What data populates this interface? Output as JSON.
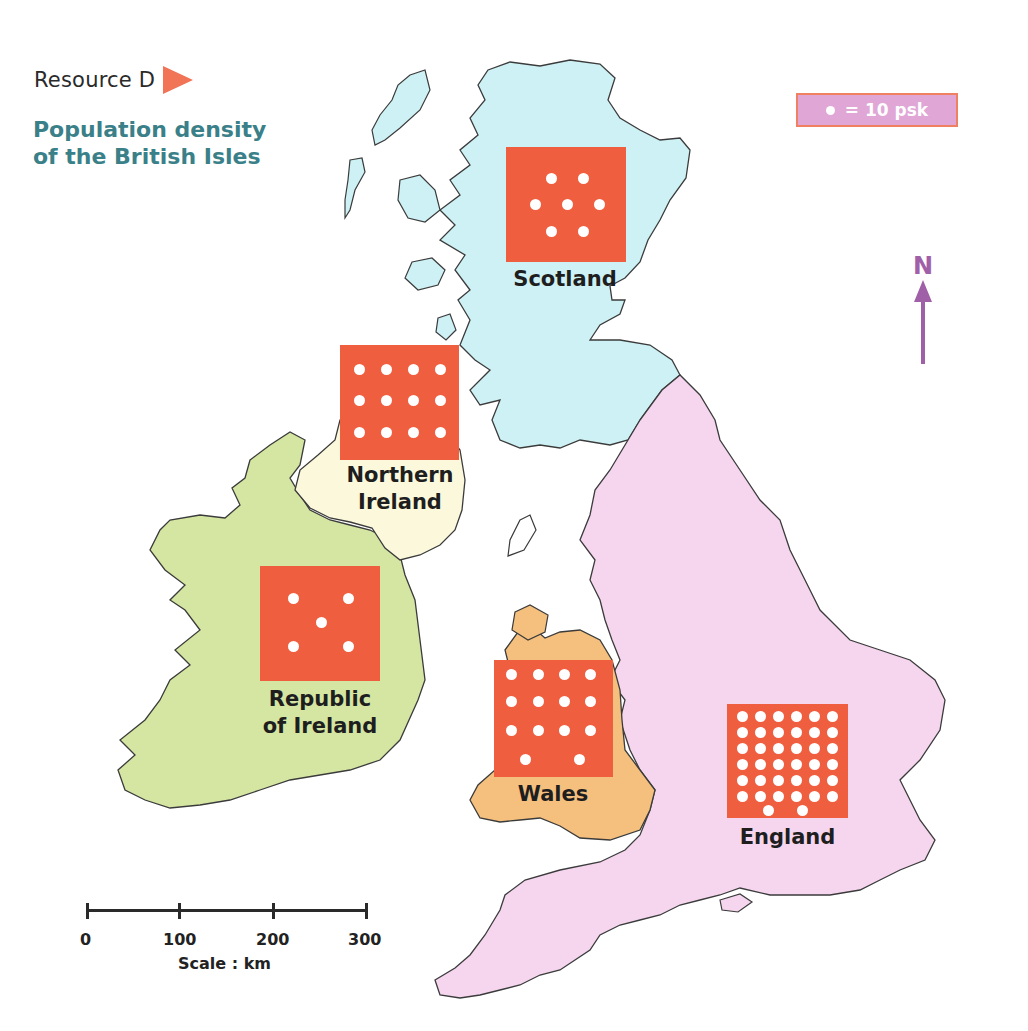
{
  "header": {
    "resource_label": "Resource D",
    "title_line1": "Population density",
    "title_line2": "of the British Isles"
  },
  "key": {
    "symbol": "dot",
    "text": "= 10 psk",
    "dot_value": 10,
    "unit": "psk",
    "background_color": "#dfa6d6",
    "border_color": "#f08062"
  },
  "compass": {
    "label": "N",
    "color": "#a060a8"
  },
  "scale": {
    "ticks": [
      "0",
      "100",
      "200",
      "300"
    ],
    "label": "Scale : km"
  },
  "colors": {
    "symbol_square": "#f05e40",
    "scotland": "#cdf1f4",
    "northern_ireland": "#fbf8dc",
    "republic_of_ireland": "#d4e6a2",
    "wales": "#f5c07e",
    "england": "#f5d6ee",
    "coastline": "#3b3b3b",
    "resource_arrow": "#f07455",
    "title_text": "#3a8088"
  },
  "regions": [
    {
      "name": "Scotland",
      "label_line1": "Scotland",
      "label_line2": "",
      "dots": 7,
      "density_psk": 70
    },
    {
      "name": "Northern Ireland",
      "label_line1": "Northern",
      "label_line2": "Ireland",
      "dots": 12,
      "density_psk": 120
    },
    {
      "name": "Republic of Ireland",
      "label_line1": "Republic",
      "label_line2": "of Ireland",
      "dots": 5,
      "density_psk": 50
    },
    {
      "name": "Wales",
      "label_line1": "Wales",
      "label_line2": "",
      "dots": 14,
      "density_psk": 140
    },
    {
      "name": "England",
      "label_line1": "England",
      "label_line2": "",
      "dots": 38,
      "density_psk": 380
    }
  ]
}
